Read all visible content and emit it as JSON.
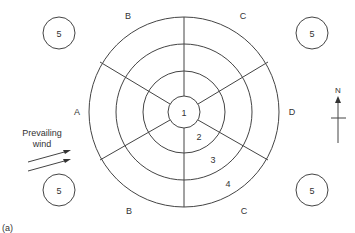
{
  "diagram": {
    "center_label": "1",
    "ring_labels": [
      "2",
      "3",
      "4"
    ],
    "sector_labels": {
      "top_left": "B",
      "top_right": "C",
      "left": "A",
      "right": "D",
      "bottom_left": "B",
      "bottom_right": "C"
    },
    "corner_circle_label": "5",
    "wind_label_line1": "Prevailing",
    "wind_label_line2": "wind",
    "north_label": "N",
    "figure_label": "(a)"
  }
}
